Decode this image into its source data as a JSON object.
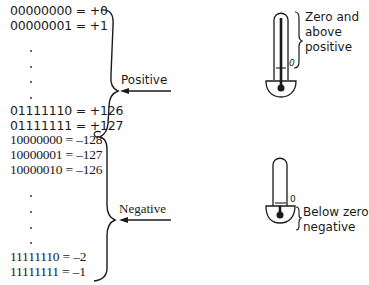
{
  "diagram": {
    "positive_block": {
      "lines": [
        "00000000 = +0",
        "00000001 = +1",
        "01111110 = +126",
        "01111111 = +127"
      ],
      "label": "Positive"
    },
    "negative_block": {
      "lines": [
        "10000000 = –128",
        "10000001 = –127",
        "10000010 = –126",
        "11111110 = –2",
        "11111111 = –1"
      ],
      "label": "Negative"
    },
    "thermometer_top": {
      "zero_mark": "0",
      "caption_lines": [
        "Zero and",
        "above",
        "positive"
      ]
    },
    "thermometer_bottom": {
      "zero_mark": "0",
      "caption_lines": [
        "Below zero",
        "negative"
      ]
    },
    "colors": {
      "ink": "#1a1a1a",
      "background": "#ffffff"
    }
  }
}
